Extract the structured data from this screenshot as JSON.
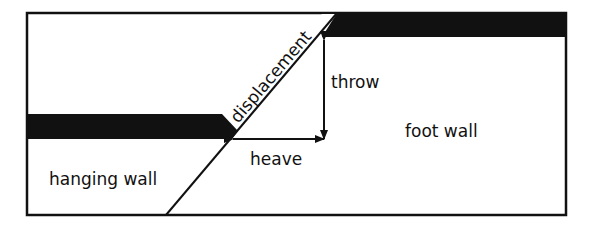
{
  "diagram": {
    "type": "geology-normal-fault",
    "labels": {
      "displacement": "displacement",
      "throw": "throw",
      "heave": "heave",
      "foot_wall": "foot wall",
      "hanging_wall": "hanging wall"
    },
    "colors": {
      "ink": "#111111",
      "background": "#ffffff"
    }
  }
}
